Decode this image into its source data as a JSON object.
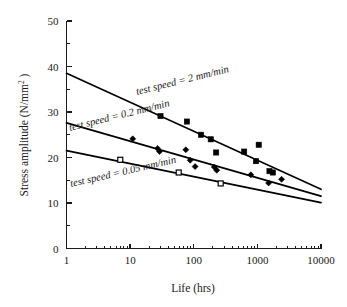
{
  "chart_data": {
    "type": "scatter",
    "title": "",
    "subtitle": "",
    "xlabel": "Life (hrs)",
    "ylabel": "Stress amplitude (N/mm2)",
    "ylabel_base": "Stress amplitude (N/mm",
    "ylabel_sup": "2",
    "ylabel_tail": " )",
    "xscale": "log",
    "yscale": "linear",
    "xlim": [
      1,
      10000
    ],
    "ylim": [
      0,
      50
    ],
    "grid": false,
    "legend_position": "inline-annotations",
    "xticks": [
      1,
      10,
      100,
      1000,
      10000
    ],
    "xticklabels": [
      "1",
      "10",
      "100",
      "1000",
      "10000"
    ],
    "yticks": [
      0,
      10,
      20,
      30,
      40,
      50
    ],
    "yticklabels": [
      "0",
      "10",
      "20",
      "30",
      "40",
      "50"
    ],
    "yminorticks": [
      5,
      15,
      25,
      35,
      45
    ],
    "series": [
      {
        "name": "test speed = 2 mm/min",
        "marker": "filled-square",
        "annotation": "test speed = 2 mm/min",
        "fit_line": {
          "x_start": 1,
          "y_start": 38.5,
          "x_end": 10000,
          "y_end": 13.0
        },
        "points": [
          {
            "x": 30,
            "y": 29.1
          },
          {
            "x": 78,
            "y": 27.9
          },
          {
            "x": 130,
            "y": 25.0
          },
          {
            "x": 185,
            "y": 24.0
          },
          {
            "x": 225,
            "y": 21.1
          },
          {
            "x": 620,
            "y": 21.3
          },
          {
            "x": 1050,
            "y": 22.8
          },
          {
            "x": 950,
            "y": 19.2
          },
          {
            "x": 1550,
            "y": 17.0
          },
          {
            "x": 1750,
            "y": 16.7
          }
        ]
      },
      {
        "name": "test speed = 0.2 mm/min",
        "marker": "filled-diamond",
        "annotation": "test speed = 0.2 mm/min",
        "fit_line": {
          "x_start": 1,
          "y_start": 27.6,
          "x_end": 10000,
          "y_end": 11.5
        },
        "points": [
          {
            "x": 11,
            "y": 24.1
          },
          {
            "x": 27,
            "y": 22.0
          },
          {
            "x": 29,
            "y": 21.3
          },
          {
            "x": 75,
            "y": 21.7
          },
          {
            "x": 88,
            "y": 19.4
          },
          {
            "x": 105,
            "y": 18.0
          },
          {
            "x": 210,
            "y": 17.9
          },
          {
            "x": 230,
            "y": 17.2
          },
          {
            "x": 790,
            "y": 16.2
          },
          {
            "x": 1500,
            "y": 14.4
          },
          {
            "x": 2400,
            "y": 15.2
          }
        ]
      },
      {
        "name": "test speed = 0.05 mm/min",
        "marker": "open-square",
        "annotation": "test speed = 0.05 mm/min",
        "fit_line": {
          "x_start": 1,
          "y_start": 21.5,
          "x_end": 10000,
          "y_end": 10.1
        },
        "points": [
          {
            "x": 7,
            "y": 19.5
          },
          {
            "x": 58,
            "y": 16.7
          },
          {
            "x": 265,
            "y": 14.3
          }
        ]
      }
    ]
  }
}
